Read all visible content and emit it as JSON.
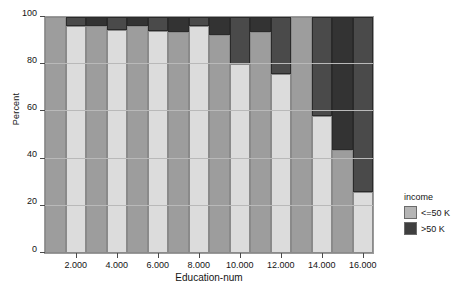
{
  "chart_data": {
    "type": "bar",
    "subtype": "stacked-percent",
    "title": "",
    "xlabel": "Education-num",
    "ylabel": "Percent",
    "ylim": [
      0,
      100
    ],
    "yticks": [
      0,
      20,
      40,
      60,
      80,
      100
    ],
    "ytick_labels": [
      "0",
      "20",
      "40",
      "60",
      "80",
      "100"
    ],
    "grid": true,
    "legend_position": "right",
    "legend_title": "income",
    "categories": [
      1,
      2,
      3,
      4,
      5,
      6,
      7,
      8,
      9,
      10,
      11,
      12,
      13,
      14,
      15,
      16
    ],
    "xtick_values": [
      2,
      4,
      6,
      8,
      10,
      12,
      14,
      16
    ],
    "xtick_labels": [
      "2.000",
      "4.000",
      "6.000",
      "8.000",
      "10.000",
      "12.000",
      "14.000",
      "16.000"
    ],
    "series": [
      {
        "name": "<=50 K",
        "color": "#c9c9c9",
        "values": [
          100,
          96,
          96,
          94.5,
          96,
          94,
          93.5,
          96,
          92.5,
          80,
          93.5,
          76,
          100,
          58,
          43.5,
          26
        ]
      },
      {
        "name": ">50 K",
        "color": "#3f3f3f",
        "values": [
          0,
          4,
          4,
          5.5,
          4,
          6,
          6.5,
          4,
          7.5,
          20,
          6.5,
          24,
          0,
          42,
          56.5,
          74
        ]
      }
    ],
    "bar_alt_colors": {
      "low_light": "#dcdcdc",
      "low_dark": "#9d9d9d",
      "high_light": "#4a4a4a",
      "high_dark": "#333333"
    }
  },
  "axes": {
    "y_title": "Percent",
    "x_title": "Education-num"
  },
  "legend": {
    "title": "income",
    "entries": [
      {
        "label": "<=50 K",
        "color": "#b5b5b5"
      },
      {
        "label": ">50 K",
        "color": "#3f3f3f"
      }
    ]
  }
}
